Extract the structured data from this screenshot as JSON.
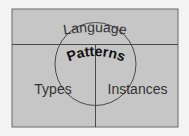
{
  "diagram": {
    "labels": {
      "top": "Language",
      "center": "Patterns",
      "left": "Types",
      "right": "Instances"
    },
    "colors": {
      "page_background": "#f3f3f3",
      "panel_fill": "#c6c6c6",
      "line": "#4a4a4a",
      "text": "#333333",
      "center_text": "#111111"
    }
  }
}
